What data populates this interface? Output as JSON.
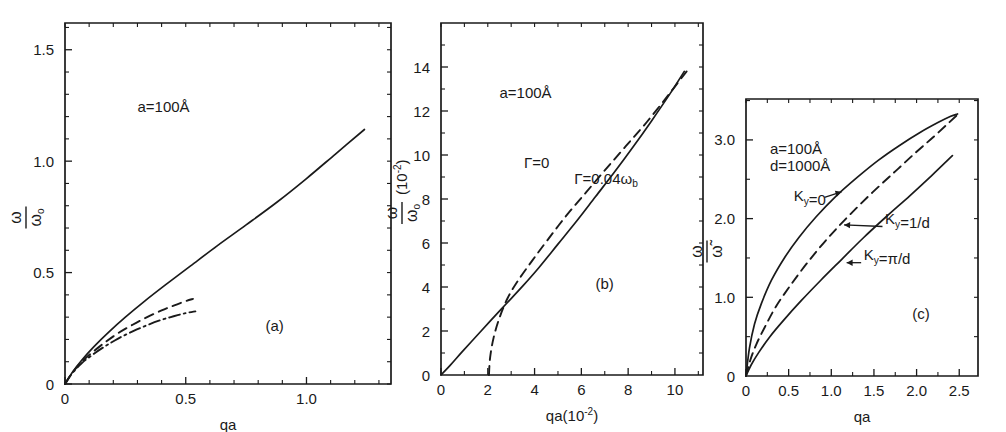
{
  "figure": {
    "background": "#ffffff",
    "line_color": "#1a1a1a",
    "panels": [
      "a",
      "b",
      "c"
    ]
  },
  "chart_data": [
    {
      "type": "line",
      "panel": "(a)",
      "title": "",
      "xlabel": "qa",
      "ylabel": "ω/ωₒ",
      "xlim": [
        0,
        1.35
      ],
      "ylim": [
        0,
        1.62
      ],
      "xticks": [
        0,
        0.5,
        1.0
      ],
      "xticklabels": [
        "0",
        "0.5",
        "1.0"
      ],
      "xminorticks": [
        0.1,
        0.2,
        0.3,
        0.4,
        0.6,
        0.7,
        0.8,
        0.9,
        1.1,
        1.2,
        1.3
      ],
      "yticks": [
        0,
        0.5,
        1.0,
        1.5
      ],
      "yticklabels": [
        "0",
        "0.5",
        "1.0",
        "1.5"
      ],
      "yminorticks": [
        0.1,
        0.2,
        0.3,
        0.4,
        0.6,
        0.7,
        0.8,
        0.9,
        1.1,
        1.2,
        1.3,
        1.4,
        1.6
      ],
      "grid": false,
      "annotations": [
        {
          "text": "a=100Å",
          "x": 0.3,
          "y": 1.22
        },
        {
          "text": "(a)",
          "x": 0.83,
          "y": 0.24
        }
      ],
      "series": [
        {
          "name": "solid-curve",
          "style": "solid",
          "x": [
            0,
            0.03,
            0.07,
            0.12,
            0.18,
            0.25,
            0.33,
            0.42,
            0.52,
            0.63,
            0.75,
            0.88,
            1.0,
            1.12,
            1.24
          ],
          "y": [
            0,
            0.052,
            0.108,
            0.168,
            0.232,
            0.3,
            0.372,
            0.448,
            0.53,
            0.62,
            0.714,
            0.818,
            0.922,
            1.032,
            1.142
          ]
        },
        {
          "name": "dashed-curve",
          "style": "dashed",
          "x": [
            0,
            0.03,
            0.07,
            0.12,
            0.17,
            0.22,
            0.28,
            0.34,
            0.4,
            0.45,
            0.5,
            0.53
          ],
          "y": [
            0,
            0.05,
            0.1,
            0.148,
            0.19,
            0.228,
            0.266,
            0.3,
            0.33,
            0.352,
            0.372,
            0.382
          ]
        },
        {
          "name": "dash-dot-curve",
          "style": "dashdot",
          "x": [
            0,
            0.03,
            0.07,
            0.12,
            0.17,
            0.22,
            0.28,
            0.34,
            0.4,
            0.45,
            0.5,
            0.54
          ],
          "y": [
            0,
            0.048,
            0.094,
            0.136,
            0.172,
            0.204,
            0.236,
            0.264,
            0.288,
            0.304,
            0.318,
            0.326
          ]
        }
      ]
    },
    {
      "type": "line",
      "panel": "(b)",
      "title": "",
      "xlabel": "qa(10⁻²)",
      "ylabel": "ω/ωₒ(10⁻²)",
      "xlim": [
        0,
        11.2
      ],
      "ylim": [
        0,
        16.0
      ],
      "xticks": [
        0,
        2,
        4,
        6,
        8,
        10
      ],
      "xticklabels": [
        "0",
        "2",
        "4",
        "6",
        "8",
        "10"
      ],
      "xminorticks": [
        1,
        3,
        5,
        7,
        9,
        11
      ],
      "yticks": [
        2,
        4,
        6,
        8,
        10,
        12,
        14
      ],
      "yticklabels": [
        "2",
        "4",
        "6",
        "8",
        "10",
        "12",
        "14"
      ],
      "yminorticks": [
        1,
        3,
        5,
        7,
        9,
        11,
        13,
        15
      ],
      "grid": false,
      "annotations": [
        {
          "text": "a=100Å",
          "x": 2.5,
          "y": 12.6
        },
        {
          "text": "(b)",
          "x": 6.6,
          "y": 3.9
        },
        {
          "text": "Γ=0",
          "x": 3.55,
          "y": 9.4
        },
        {
          "text": "Γ=0.04ω_b",
          "x": 5.7,
          "y": 8.7
        }
      ],
      "series": [
        {
          "name": "gamma-zero-curve",
          "style": "solid",
          "label": "Γ=0",
          "x": [
            0,
            0.4,
            0.9,
            1.5,
            2.1,
            2.8,
            3.5,
            4.2,
            5.0,
            5.8,
            6.6,
            7.4,
            8.2,
            9.0,
            9.8,
            10.4
          ],
          "y": [
            0,
            0.45,
            1.05,
            1.75,
            2.45,
            3.25,
            4.05,
            4.9,
            5.95,
            7.0,
            8.1,
            9.2,
            10.35,
            11.55,
            12.8,
            13.8
          ]
        },
        {
          "name": "gamma-damped-curve",
          "style": "dashed",
          "label": "Γ=0.04ω_b",
          "x": [
            2.05,
            2.1,
            2.25,
            2.5,
            2.85,
            3.3,
            3.9,
            4.6,
            5.4,
            6.2,
            7.0,
            7.9,
            8.8,
            9.7,
            10.5
          ],
          "y": [
            0,
            0.8,
            1.7,
            2.6,
            3.5,
            4.3,
            5.2,
            6.2,
            7.3,
            8.3,
            9.3,
            10.4,
            11.5,
            12.7,
            13.8
          ]
        }
      ]
    },
    {
      "type": "line",
      "panel": "(c)",
      "title": "",
      "xlabel": "qa",
      "ylabel": "ω/ω̃",
      "xlim": [
        0,
        2.72
      ],
      "ylim": [
        0,
        3.52
      ],
      "xticks": [
        0,
        0.5,
        1.0,
        1.5,
        2.0,
        2.5
      ],
      "xticklabels": [
        "0",
        "0.5",
        "1.0",
        "1.5",
        "2.0",
        "2.5"
      ],
      "xminorticks": [
        0.25,
        0.75,
        1.25,
        1.75,
        2.25
      ],
      "yticks": [
        1.0,
        2.0,
        3.0
      ],
      "yticklabels": [
        "1.0",
        "2.0",
        "3.0"
      ],
      "yminorticks": [
        0.5,
        1.5,
        2.5,
        3.5
      ],
      "grid": false,
      "annotations": [
        {
          "text": "a=100Å",
          "x": 0.28,
          "y": 2.82
        },
        {
          "text": "d=1000Å",
          "x": 0.28,
          "y": 2.6
        },
        {
          "text": "K_y=0",
          "x": 0.56,
          "y": 2.22
        },
        {
          "text": "K_y=1/d",
          "x": 1.63,
          "y": 1.93
        },
        {
          "text": "K_y=π/d",
          "x": 1.38,
          "y": 1.47
        },
        {
          "text": "(c)",
          "x": 1.95,
          "y": 0.73
        }
      ],
      "series": [
        {
          "name": "ky-zero-curve",
          "style": "solid",
          "label": "K_y=0",
          "x": [
            0,
            0.04,
            0.1,
            0.18,
            0.3,
            0.45,
            0.62,
            0.82,
            1.05,
            1.3,
            1.55,
            1.8,
            2.05,
            2.25,
            2.4,
            2.48
          ],
          "y": [
            0,
            0.35,
            0.66,
            0.92,
            1.22,
            1.5,
            1.76,
            2.02,
            2.28,
            2.52,
            2.74,
            2.93,
            3.1,
            3.22,
            3.3,
            3.33
          ]
        },
        {
          "name": "ky-inv-d-curve",
          "style": "dashed",
          "label": "K_y=1/d",
          "x": [
            0,
            0.05,
            0.12,
            0.22,
            0.35,
            0.52,
            0.72,
            0.95,
            1.2,
            1.48,
            1.75,
            2.0,
            2.2,
            2.38,
            2.48
          ],
          "y": [
            0,
            0.2,
            0.4,
            0.62,
            0.88,
            1.15,
            1.44,
            1.74,
            2.03,
            2.33,
            2.6,
            2.85,
            3.04,
            3.22,
            3.32
          ]
        },
        {
          "name": "ky-pi-d-curve",
          "style": "solid",
          "label": "K_y=π/d",
          "x": [
            0,
            0.06,
            0.15,
            0.28,
            0.45,
            0.65,
            0.88,
            1.12,
            1.38,
            1.65,
            1.92,
            2.18,
            2.42
          ],
          "y": [
            0,
            0.14,
            0.3,
            0.5,
            0.72,
            0.96,
            1.22,
            1.48,
            1.76,
            2.03,
            2.29,
            2.55,
            2.8
          ]
        }
      ]
    }
  ]
}
